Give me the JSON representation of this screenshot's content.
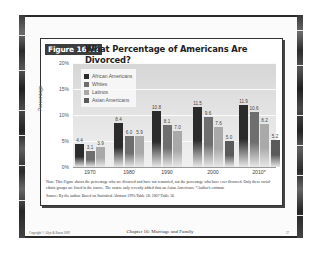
{
  "slide": {
    "figure_badge": "Figure 16.12",
    "title": "What Percentage of Americans Are Divorced?",
    "note": "Note: This Figure shows the percentage who are divorced and have not remarried, not the percentage who have ever divorced. Only these racial-ethnic groups are listed in the source. The source only recently added data on Asian Americans. *Author's estimate",
    "source": "Source: By the author. Based on Statistical Abstract 1995:Table 58; 2007:Table 56.",
    "footer": {
      "copyright": "Copyright © Allyn & Bacon 2009",
      "chapter": "Chapter 16: Marriage and Family",
      "page": "37"
    }
  },
  "chart_data": {
    "type": "bar",
    "title": "What Percentage of Americans Are Divorced?",
    "xlabel": "",
    "ylabel": "Percentage",
    "ylim": [
      0,
      20
    ],
    "yticks": [
      "0%",
      "5%",
      "10%",
      "15%",
      "20%"
    ],
    "grid": true,
    "legend_position": "upper left",
    "categories": [
      "1970",
      "1980",
      "1990",
      "2000",
      "2010*"
    ],
    "series": [
      {
        "name": "African Americans",
        "color": "#2b2b2b",
        "values": [
          4.4,
          8.4,
          10.8,
          11.5,
          11.9
        ]
      },
      {
        "name": "Whites",
        "color": "#6e6e6e",
        "values": [
          3.1,
          6.0,
          8.1,
          9.6,
          10.6
        ]
      },
      {
        "name": "Latinos",
        "color": "#a9a9a9",
        "values": [
          3.9,
          5.9,
          7.0,
          7.6,
          8.2
        ]
      },
      {
        "name": "Asian Americans",
        "color": "#5a5a5a",
        "values": [
          null,
          null,
          null,
          5.0,
          5.2
        ]
      }
    ]
  }
}
